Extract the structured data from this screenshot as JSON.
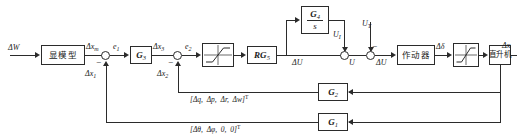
{
  "diagram": {
    "blocks": {
      "explicit_model": "显模型",
      "g3": "G",
      "g3_sub": "3",
      "rg5": "RG",
      "rg5_sub": "5",
      "g4_num": "G",
      "g4_num_sub": "4",
      "g4_den": "s",
      "actuator": "作动器",
      "helicopter": "直升机",
      "g2": "G",
      "g2_sub": "2",
      "g1": "G",
      "g1_sub": "1",
      "saturation_mid": "saturation-nonlinearity",
      "saturation_right": "saturation-nonlinearity"
    },
    "signals": {
      "input": "ΔW",
      "xm": "Δx",
      "xm_sub": "m",
      "e1": "e",
      "e1_sub": "1",
      "x1": "Δx",
      "x1_sub": "1",
      "x3": "Δx",
      "x3_sub": "3",
      "e2": "e",
      "e2_sub": "2",
      "x2": "Δx",
      "x2_sub": "2",
      "delta_u_in": "ΔU",
      "u_i": "U",
      "u_i_sub": "I",
      "u_t": "U",
      "u_t_sub": "T",
      "u": "U",
      "delta_u_out": "ΔU",
      "delta_delta": "Δδ",
      "output": "Δx"
    },
    "signs": {
      "sum1_minus": "−",
      "sum2_minus": "−",
      "sum_ut_minus": "−"
    },
    "feedback_vectors": {
      "upper": {
        "open": "[",
        "q": "Δq,",
        "p": "Δp,",
        "r": "Δr,",
        "w": "Δw]",
        "transpose": "T"
      },
      "lower": {
        "open": "[",
        "theta": "Δθ,",
        "phi": "Δφ,",
        "zero1": "0,",
        "zero2": "0]",
        "transpose": "T"
      }
    },
    "colors": {
      "line": "#2b2b2b",
      "background": "#ffffff"
    }
  }
}
